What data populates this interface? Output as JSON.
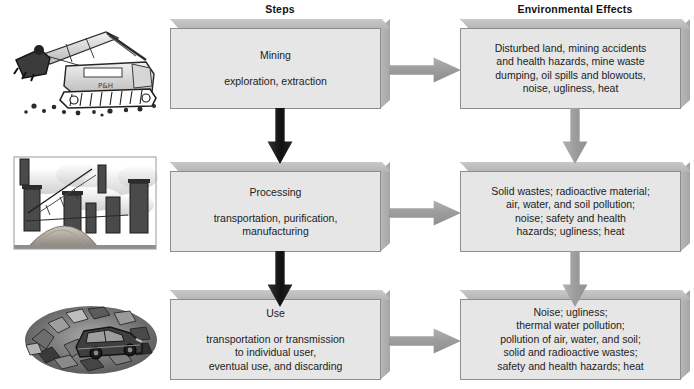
{
  "headers": {
    "steps": "Steps",
    "effects": "Environmental Effects"
  },
  "colors": {
    "box_face": "#e6e6e6",
    "box_border": "#8d8d8d",
    "box_bevel": "#b4b4b4",
    "arrow_gray": "#9a9a9a",
    "arrow_dark": "#1a1a1a",
    "background": "#ffffff",
    "text": "#222222"
  },
  "rows": [
    {
      "id": "mining",
      "illustration_name": "mining-excavator-illustration",
      "step": {
        "title": "Mining",
        "subtitle": "exploration, extraction"
      },
      "effect": {
        "lines": [
          "Disturbed land, mining accidents",
          "and health hazards, mine waste",
          "dumping, oil spills and blowouts,",
          "noise, ugliness, heat"
        ],
        "text": "Disturbed land, mining accidents and health hazards, mine waste dumping, oil spills and blowouts, noise, ugliness, heat"
      }
    },
    {
      "id": "processing",
      "illustration_name": "industrial-smokestacks-illustration",
      "step": {
        "title": "Processing",
        "subtitle": "transportation, purification, manufacturing"
      },
      "effect": {
        "lines": [
          "Solid wastes; radioactive material;",
          "air, water, and soil pollution;",
          "noise; safety and health",
          "hazards; ugliness; heat"
        ],
        "text": "Solid wastes; radioactive material; air, water, and soil pollution; noise; safety and health hazards; ugliness; heat"
      }
    },
    {
      "id": "use",
      "illustration_name": "junkyard-scrapped-car-illustration",
      "step": {
        "title": "Use",
        "subtitle": "transportation or transmission to individual user, eventual use, and discarding"
      },
      "effect": {
        "lines": [
          "Noise; ugliness;",
          "thermal water pollution;",
          "pollution of air, water, and soil;",
          "solid and radioactive wastes;",
          "safety and health hazards; heat"
        ],
        "text": "Noise; ugliness; thermal water pollution; pollution of air, water, and soil; solid and radioactive wastes; safety and health hazards; heat"
      }
    }
  ],
  "step_subtitle_lines": {
    "mining": [
      "exploration, extraction"
    ],
    "processing": [
      "transportation, purification,",
      "manufacturing"
    ],
    "use": [
      "transportation or transmission",
      "to individual user,",
      "eventual use, and discarding"
    ]
  },
  "arrows": {
    "horizontal_label": "step-to-effect-arrow",
    "vertical_label": "flow-down-arrow"
  }
}
